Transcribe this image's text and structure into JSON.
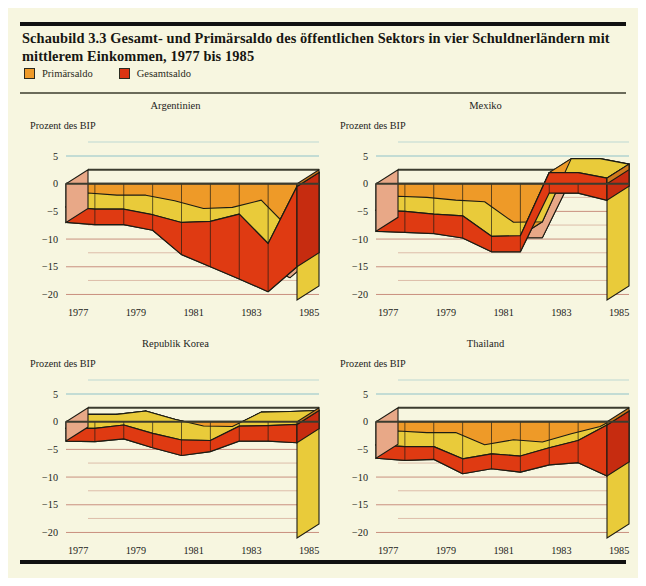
{
  "figure": {
    "label": "Schaubild 3.3",
    "title": "Schaubild 3.3  Gesamt- und Primärsaldo des öffentlichen Sektors in vier Schuldnerländern mit mittlerem Einkommen, 1977 bis 1985",
    "background_color": "#f7f6e0"
  },
  "legend": {
    "position": "top-left",
    "items": [
      {
        "label": "Primärsaldo",
        "color": "#EE9A28",
        "border_color": "#2b2b20"
      },
      {
        "label": "Gesamtsaldo",
        "color": "#DC3412",
        "border_color": "#2b2b20"
      }
    ]
  },
  "colors": {
    "primary_top": "#EE9A28",
    "primary_side": "#E9CB3A",
    "total_top": "#DF3A12",
    "total_side": "#E8A887",
    "outline": "#1c1c14",
    "axis_zero": "#3b3b2e",
    "gridline": "#c9907f",
    "gridline_top": "#8fc2c8",
    "background": "#f7f6e0"
  },
  "axes": {
    "y_label": "Prozent des BIP",
    "y_ticks": [
      "5",
      "0",
      "−5",
      "−10",
      "−15",
      "−20"
    ],
    "y_values": [
      5,
      0,
      -5,
      -10,
      -15,
      -20
    ],
    "y_min": -21,
    "y_max": 5,
    "x_ticks": [
      "1977",
      "1979",
      "1981",
      "1983",
      "1985"
    ],
    "x_values": [
      1977,
      1979,
      1981,
      1983,
      1985
    ],
    "x_min": 1977,
    "x_max": 1985,
    "grid": true
  },
  "chart_data": {
    "type": "area",
    "title": "Schaubild 3.3  Gesamt- und Primärsaldo des öffentlichen Sektors in vier Schuldnerländern mit mittlerem Einkommen, 1977 bis 1985",
    "xlabel": "",
    "ylabel": "Prozent des BIP",
    "ylim": [
      -21,
      5
    ],
    "grid": true,
    "legend_position": "top-left",
    "x": [
      1977,
      1978,
      1979,
      1980,
      1981,
      1982,
      1983,
      1984,
      1985
    ],
    "panels": [
      {
        "name": "Argentinien",
        "title": "Argentinien",
        "series": [
          {
            "name": "Primärsaldo",
            "values": [
              -4.2,
              -4.6,
              -4.6,
              -5.6,
              -7.0,
              -6.8,
              -5.5,
              -10.8,
              -0.5
            ]
          },
          {
            "name": "Gesamtsaldo",
            "values": [
              -7.0,
              -7.4,
              -7.4,
              -8.4,
              -12.8,
              -15.0,
              -17.2,
              -19.5,
              -15.0
            ]
          }
        ]
      },
      {
        "name": "Mexiko",
        "title": "Mexiko",
        "series": [
          {
            "name": "Primärsaldo",
            "values": [
              -4.8,
              -5.0,
              -5.5,
              -5.8,
              -9.5,
              -9.4,
              2.0,
              2.0,
              1.0
            ]
          },
          {
            "name": "Gesamtsaldo",
            "values": [
              -8.6,
              -8.8,
              -9.0,
              -9.8,
              -12.3,
              -12.3,
              -1.7,
              -1.7,
              -3.0
            ]
          }
        ]
      },
      {
        "name": "Republik Korea",
        "title": "Republik Korea",
        "series": [
          {
            "name": "Primärsaldo",
            "values": [
              -1.2,
              -1.2,
              -0.6,
              -2.1,
              -3.3,
              -3.4,
              -0.8,
              -0.7,
              -0.5
            ]
          },
          {
            "name": "Gesamtsaldo",
            "values": [
              -3.5,
              -3.6,
              -3.1,
              -4.7,
              -6.1,
              -5.4,
              -3.5,
              -3.5,
              -3.8
            ]
          }
        ]
      },
      {
        "name": "Thailand",
        "title": "Thailand",
        "series": [
          {
            "name": "Primärsaldo",
            "values": [
              -4.2,
              -4.5,
              -4.5,
              -6.7,
              -5.8,
              -6.2,
              -4.7,
              -3.4,
              -0.6
            ]
          },
          {
            "name": "Gesamtsaldo",
            "values": [
              -6.6,
              -7.0,
              -6.8,
              -9.4,
              -8.5,
              -9.1,
              -7.8,
              -7.4,
              -9.8
            ]
          }
        ]
      }
    ]
  }
}
